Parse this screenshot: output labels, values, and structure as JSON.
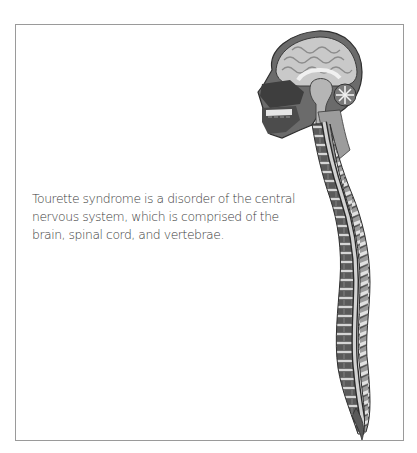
{
  "figure": {
    "caption_lines": [
      "Tourette syndrome is a disorder of the central",
      "nervous system, which is comprised of the",
      "brain, spinal cord, and vertebrae."
    ],
    "illustration": "sagittal-head-and-spine-illustration",
    "colors": {
      "border": "#9a9a9a",
      "text": "#3a3a3a",
      "illustration_dark": "#3c3c3c",
      "illustration_mid": "#8a8a8a",
      "illustration_light": "#d8d8d8"
    }
  }
}
